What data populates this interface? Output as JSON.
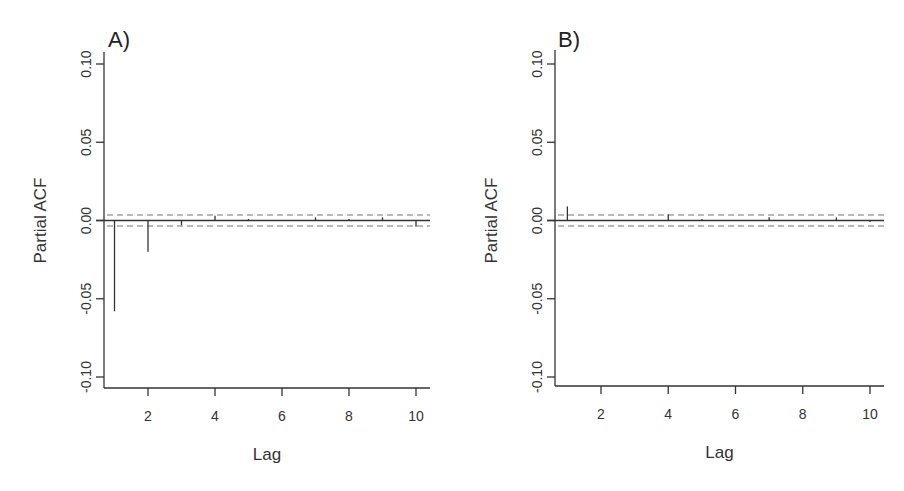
{
  "chart_data": [
    {
      "type": "bar",
      "title": "A)",
      "xlabel": "Lag",
      "ylabel": "Partial ACF",
      "x": [
        1,
        2,
        3,
        4,
        5,
        6,
        7,
        8,
        9,
        10
      ],
      "values": [
        -0.058,
        -0.02,
        -0.003,
        0.003,
        0.001,
        0.0,
        0.002,
        0.001,
        0.002,
        -0.004
      ],
      "confidence_bounds": [
        -0.0035,
        0.0035
      ],
      "xticks": [
        "2",
        "4",
        "6",
        "8",
        "10"
      ],
      "yticks": [
        "-0.10",
        "-0.05",
        "0.00",
        "0.05",
        "0.10"
      ],
      "ylim": [
        -0.11,
        0.11
      ],
      "xlim": [
        0.6,
        10.4
      ],
      "grid": false
    },
    {
      "type": "bar",
      "title": "B)",
      "xlabel": "Lag",
      "ylabel": "Partial ACF",
      "x": [
        1,
        2,
        3,
        4,
        5,
        6,
        7,
        8,
        9,
        10
      ],
      "values": [
        0.009,
        0.0,
        0.0,
        0.004,
        0.001,
        0.0,
        0.002,
        0.0,
        0.002,
        -0.001
      ],
      "confidence_bounds": [
        -0.0035,
        0.0035
      ],
      "xticks": [
        "2",
        "4",
        "6",
        "8",
        "10"
      ],
      "yticks": [
        "-0.10",
        "-0.05",
        "0.00",
        "0.05",
        "0.10"
      ],
      "ylim": [
        -0.11,
        0.11
      ],
      "xlim": [
        0.6,
        10.4
      ],
      "grid": false
    }
  ],
  "panels": [
    {
      "label": "A)",
      "xlabel": "Lag",
      "ylabel": "Partial ACF",
      "yticks": [
        "0.10",
        "0.05",
        "0.00",
        "-0.05",
        "-0.10"
      ],
      "xticks": [
        "2",
        "4",
        "6",
        "8",
        "10"
      ]
    },
    {
      "label": "B)",
      "xlabel": "Lag",
      "ylabel": "Partial ACF",
      "yticks": [
        "0.10",
        "0.05",
        "0.00",
        "-0.05",
        "-0.10"
      ],
      "xticks": [
        "2",
        "4",
        "6",
        "8",
        "10"
      ]
    }
  ]
}
